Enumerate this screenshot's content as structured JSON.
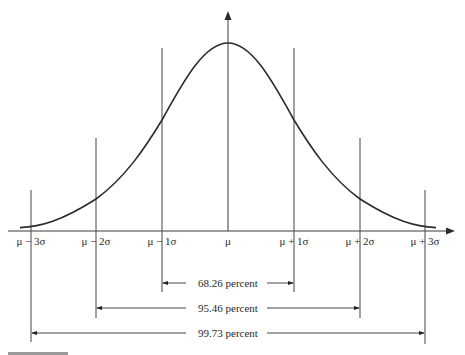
{
  "diagram": {
    "type": "normal-distribution",
    "colors": {
      "stroke": "#3a3a3a",
      "curve": "#2b2b2b",
      "text": "#2a2a2a",
      "background": "#ffffff"
    },
    "axis_labels": [
      {
        "id": "m3",
        "text": "μ − 3σ",
        "x": 31
      },
      {
        "id": "m2",
        "text": "μ − 2σ",
        "x": 96
      },
      {
        "id": "m1",
        "text": "μ − 1σ",
        "x": 162
      },
      {
        "id": "mu",
        "text": "μ",
        "x": 228
      },
      {
        "id": "p1",
        "text": "μ + 1σ",
        "x": 294
      },
      {
        "id": "p2",
        "text": "μ + 2σ",
        "x": 360
      },
      {
        "id": "p3",
        "text": "μ + 3σ",
        "x": 425
      }
    ],
    "intervals": [
      {
        "id": "one-sigma",
        "label": "68.26 percent",
        "from": "μ − 1σ",
        "to": "μ + 1σ",
        "value": 68.26
      },
      {
        "id": "two-sigma",
        "label": "95.46 percent",
        "from": "μ − 2σ",
        "to": "μ + 2σ",
        "value": 95.46
      },
      {
        "id": "three-sigma",
        "label": "99.73 percent",
        "from": "μ − 3σ",
        "to": "μ + 3σ",
        "value": 99.73
      }
    ]
  }
}
